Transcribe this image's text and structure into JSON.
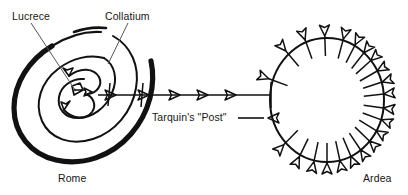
{
  "figure": {
    "type": "hand-drawn schematic map",
    "background_color": "#ffffff",
    "ink_color": "#111111",
    "width": 408,
    "height": 195
  },
  "labels": {
    "lucrece": "Lucrece",
    "collatium": "Collatium",
    "tarquins_post": "Tarquin's \"Post\"",
    "rome": "Rome",
    "ardea": "Ardea"
  },
  "diagram": {
    "rome": {
      "name": "Rome",
      "shape": "spiral",
      "turns": 3,
      "center": [
        88,
        95
      ],
      "outer_radius_x": 72,
      "outer_radius_y": 62,
      "inner_arrows": 2,
      "description": "Concentric spiral with a thick outer stroke on the lower-left and two small curved arrows at the core"
    },
    "ardea": {
      "name": "Ardea",
      "shape": "circle",
      "center": [
        327,
        100
      ],
      "radius_x": 57,
      "radius_y": 62,
      "inward_arrow_count": 22,
      "description": "Closed circle ringed by inward-pointing open arrowheads"
    },
    "connector": {
      "name": "Tarquin's \"Post\"",
      "from": [
        120,
        95
      ],
      "to": [
        270,
        95
      ],
      "arrowhead_count": 5,
      "arrow_direction": "left (toward Rome)",
      "tick_count": 2,
      "side_arrow": {
        "direction": "right (into Ardea)",
        "from": [
          236,
          118
        ],
        "to": [
          268,
          118
        ]
      }
    },
    "leaders": [
      {
        "label": "Lucrece",
        "from": [
          31,
          22
        ],
        "to": [
          74,
          89
        ]
      },
      {
        "label": "Collatium",
        "from": [
          128,
          22
        ],
        "to": [
          108,
          64
        ]
      }
    ]
  }
}
